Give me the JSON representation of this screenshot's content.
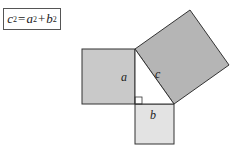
{
  "formula": {
    "text": "c²=a²+b²",
    "c": "c",
    "a": "a",
    "b": "b",
    "exp": "2",
    "eq": "=",
    "plus": "+"
  },
  "diagram": {
    "labels": {
      "a": "a",
      "b": "b",
      "c": "c"
    },
    "colors": {
      "square_a": "#c9c9c9",
      "square_b": "#e3e3e3",
      "square_c": "#b5b5b5",
      "stroke": "#333333"
    }
  }
}
